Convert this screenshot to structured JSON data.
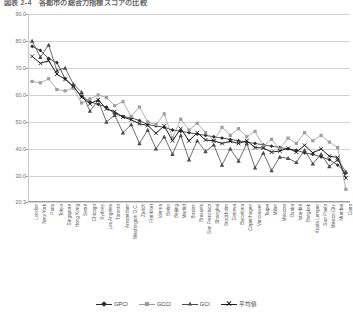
{
  "title": "図表 2-4　各都市の総合力指標スコアの比較",
  "legend": {
    "position": "bottom",
    "items": [
      {
        "label": "GPCI",
        "marker": "diamond",
        "color": "#2b2b2b"
      },
      {
        "label": "GCCI",
        "marker": "square",
        "color": "#9d9d9d"
      },
      {
        "label": "GCI",
        "marker": "triangle",
        "color": "#4a4a4a"
      },
      {
        "label": "平均値",
        "marker": "cross",
        "color": "#1f1f1f"
      }
    ]
  },
  "chart_data": {
    "type": "line",
    "title": "図表 2-4　各都市の総合力指標スコアの比較",
    "xlabel": "",
    "ylabel": "",
    "ylim": [
      20.3,
      90.0
    ],
    "yticks": [
      "90.0",
      "80.0",
      "70.0",
      "60.0",
      "50.0",
      "40.0",
      "30.0",
      "20.3"
    ],
    "ytick_values": [
      90.0,
      80.0,
      70.0,
      60.0,
      50.0,
      40.0,
      30.0,
      20.3
    ],
    "grid": true,
    "legend_position": "bottom",
    "categories": [
      "London",
      "New York",
      "Paris",
      "Tokyo",
      "Singapore",
      "Hong Kong",
      "Seoul",
      "Chicago",
      "Sydney",
      "Los Angeles",
      "Toronto",
      "Amsterdam",
      "Washington D.C.",
      "Zurich",
      "Frankfurt",
      "Vienna",
      "Berlin",
      "Beijing",
      "Madrid",
      "Boston",
      "Brussels",
      "San Francisco",
      "Shanghai",
      "Stockholm",
      "Geneva",
      "Barcelona",
      "Copenhagen",
      "Vancouver",
      "Taipei",
      "Milan",
      "Moscow",
      "Osaka",
      "Istanbul",
      "Bangkok",
      "Kuala Lumpur",
      "Sao Paulo",
      "Mexico City",
      "Mumbai",
      "Cairo"
    ],
    "series": [
      {
        "name": "GPCI",
        "marker": "diamond",
        "color": "#2b2b2b",
        "values": [
          78.0,
          76.5,
          73.5,
          72.0,
          66.0,
          63.0,
          59.5,
          57.5,
          56.5,
          55.5,
          53.0,
          52.0,
          51.5,
          50.5,
          49.0,
          48.5,
          48.0,
          47.0,
          46.5,
          46.0,
          45.5,
          45.0,
          44.5,
          44.0,
          43.5,
          43.0,
          42.5,
          42.0,
          41.5,
          41.0,
          40.5,
          40.0,
          39.5,
          38.5,
          38.0,
          37.0,
          36.0,
          34.0,
          31.0
        ]
      },
      {
        "name": "GCCI",
        "marker": "square",
        "color": "#9d9d9d",
        "values": [
          65.0,
          64.5,
          66.0,
          62.0,
          61.5,
          62.5,
          57.0,
          58.5,
          60.0,
          59.0,
          56.0,
          57.5,
          52.0,
          55.5,
          50.0,
          49.0,
          53.0,
          44.0,
          51.0,
          47.0,
          49.5,
          46.0,
          43.0,
          48.0,
          45.0,
          47.5,
          44.5,
          46.5,
          41.0,
          43.5,
          40.0,
          44.0,
          42.0,
          46.0,
          43.0,
          45.0,
          42.5,
          40.5,
          25.0
        ]
      },
      {
        "name": "GCI",
        "marker": "triangle",
        "color": "#4a4a4a",
        "values": [
          80.0,
          74.0,
          78.5,
          69.0,
          70.0,
          64.0,
          61.0,
          54.0,
          58.0,
          50.0,
          52.5,
          46.0,
          49.0,
          42.0,
          47.0,
          40.0,
          44.5,
          38.0,
          45.0,
          36.0,
          43.0,
          39.0,
          41.5,
          34.0,
          40.0,
          35.5,
          42.0,
          33.0,
          38.5,
          32.0,
          37.0,
          36.5,
          35.0,
          39.5,
          34.5,
          38.0,
          33.5,
          36.0,
          31.5
        ]
      },
      {
        "name": "平均値",
        "marker": "cross",
        "color": "#1f1f1f",
        "values": [
          74.3,
          71.7,
          72.7,
          67.7,
          65.8,
          63.2,
          59.2,
          56.7,
          58.2,
          54.8,
          53.8,
          51.8,
          50.8,
          49.3,
          48.7,
          45.8,
          48.5,
          43.0,
          47.5,
          43.0,
          46.0,
          43.3,
          43.0,
          42.0,
          42.8,
          42.0,
          43.0,
          40.5,
          40.3,
          38.8,
          39.2,
          40.2,
          38.8,
          41.3,
          38.5,
          40.0,
          37.3,
          36.8,
          29.2
        ]
      }
    ]
  }
}
